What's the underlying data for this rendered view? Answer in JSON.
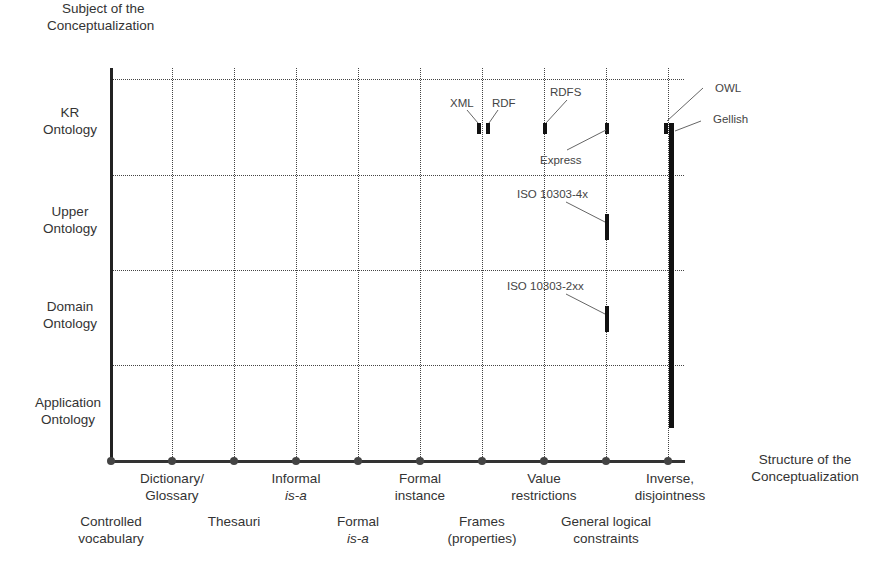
{
  "diagram": {
    "y_axis_title": [
      "Subject of the",
      "Conceptualization"
    ],
    "x_axis_title": [
      "Structure of the",
      "Conceptualization"
    ],
    "rows": [
      {
        "label": [
          "KR",
          "Ontology"
        ]
      },
      {
        "label": [
          "Upper",
          "Ontology"
        ]
      },
      {
        "label": [
          "Domain",
          "Ontology"
        ]
      },
      {
        "label": [
          "Application",
          "Ontology"
        ]
      }
    ],
    "columns": [
      {
        "label": [
          "Controlled",
          "vocabulary"
        ],
        "level": "low"
      },
      {
        "label": [
          "Dictionary/",
          "Glossary"
        ],
        "level": "high"
      },
      {
        "label": [
          "Thesauri"
        ],
        "level": "low"
      },
      {
        "label": [
          "Informal",
          "is-a"
        ],
        "level": "high",
        "italic_line": 1
      },
      {
        "label": [
          "Formal",
          "is-a"
        ],
        "level": "low",
        "italic_line": 1
      },
      {
        "label": [
          "Formal",
          "instance"
        ],
        "level": "high"
      },
      {
        "label": [
          "Frames",
          "(properties)"
        ],
        "level": "low"
      },
      {
        "label": [
          "Value",
          "restrictions"
        ],
        "level": "high"
      },
      {
        "label": [
          "General logical",
          "constraints"
        ],
        "level": "low"
      },
      {
        "label": [
          "Inverse,",
          "disjointness"
        ],
        "level": "high"
      }
    ],
    "languages": [
      {
        "name": "XML",
        "column": "Frames (properties)",
        "row": "KR Ontology"
      },
      {
        "name": "RDF",
        "column": "Frames (properties)",
        "row": "KR Ontology"
      },
      {
        "name": "RDFS",
        "column": "Value restrictions",
        "row": "KR Ontology"
      },
      {
        "name": "Express",
        "column": "General logical constraints",
        "row": "KR Ontology"
      },
      {
        "name": "ISO 10303-4x",
        "column": "General logical constraints",
        "row": "Upper Ontology"
      },
      {
        "name": "ISO 10303-2xx",
        "column": "General logical constraints",
        "row": "Domain Ontology"
      },
      {
        "name": "OWL",
        "column": "Inverse, disjointness",
        "row": "KR Ontology"
      },
      {
        "name": "Gellish",
        "column": "Inverse, disjointness",
        "row": "KR Ontology to Application Ontology"
      }
    ],
    "colors": {
      "line": "#444444",
      "bar": "#111111",
      "text": "#333333"
    }
  }
}
